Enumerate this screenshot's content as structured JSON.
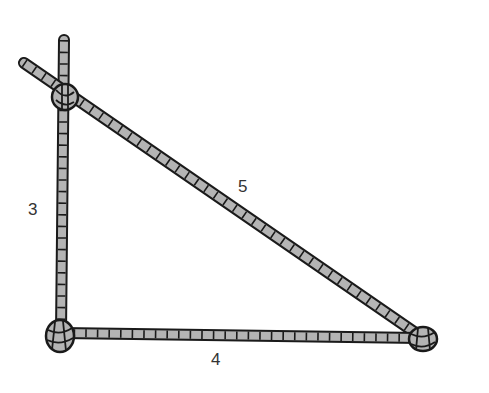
{
  "diagram": {
    "rope_color": "#b4b4b4",
    "outline_color": "#1a1a1a",
    "labels": {
      "vertical_side": "3",
      "hypotenuse": "5",
      "base": "4"
    },
    "vertices": {
      "top": [
        65,
        97
      ],
      "bottom_left": [
        60,
        336
      ],
      "bottom_right": [
        423,
        339
      ]
    }
  }
}
